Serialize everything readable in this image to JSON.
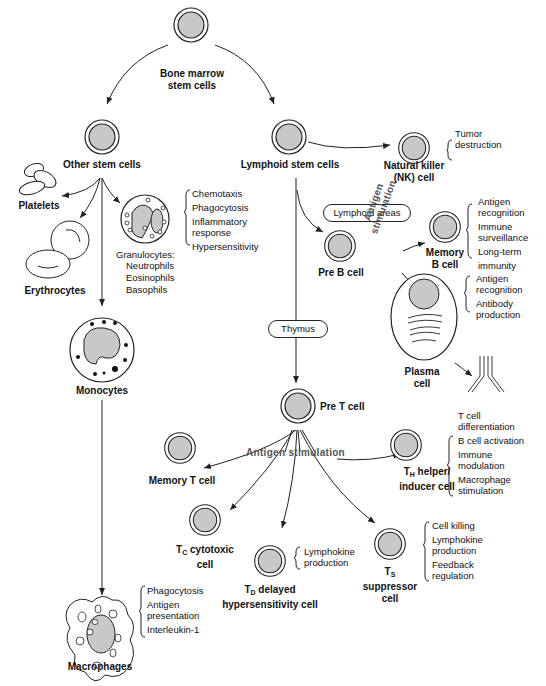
{
  "diagram": {
    "nodes": {
      "bone_marrow": {
        "label_line1": "Bone marrow",
        "label_line2": "stem cells"
      },
      "other_stem": {
        "label": "Other stem cells"
      },
      "lymphoid_stem": {
        "label": "Lymphoid stem cells"
      },
      "nk_cell": {
        "label_line1": "Natural killer",
        "label_line2": "(NK) cell",
        "functions": [
          "Tumor",
          "destruction"
        ]
      },
      "platelets": {
        "label": "Platelets"
      },
      "erythrocytes": {
        "label": "Erythrocytes"
      },
      "granulocytes": {
        "label": "Granulocytes:",
        "types": [
          "Neutrophils",
          "Eosinophils",
          "Basophils"
        ],
        "functions": [
          "Chemotaxis",
          "Phagocytosis",
          "Inflammatory",
          "response",
          "Hypersensitivity"
        ]
      },
      "monocytes": {
        "label": "Monocytes"
      },
      "macrophages": {
        "label": "Macrophages",
        "functions": [
          "Phagocytosis",
          "Antigen",
          "presentation",
          "Interleukin-1"
        ]
      },
      "pre_b": {
        "label": "Pre B cell"
      },
      "memory_b": {
        "label_line1": "Memory",
        "label_line2": "B cell",
        "functions": [
          "Antigen",
          "recognition",
          "Immune",
          "surveillance",
          "Long-term",
          "immunity"
        ]
      },
      "plasma": {
        "label_line1": "Plasma",
        "label_line2": "cell",
        "functions": [
          "Antigen",
          "recognition",
          "Antibody",
          "production"
        ]
      },
      "pre_t": {
        "label": "Pre T cell"
      },
      "memory_t": {
        "label": "Memory T cell"
      },
      "th_cell": {
        "label_sub": "H",
        "label_line1_rest": " helper/",
        "label_line2": "inducer cell",
        "functions": [
          "T cell",
          "differentiation",
          "B cell activation",
          "Immune",
          "modulation",
          "Macrophage",
          "stimulation"
        ]
      },
      "tc_cell": {
        "label_sub": "C",
        "label_line1_rest": " cytotoxic",
        "label_line2": "cell"
      },
      "td_cell": {
        "label_sub": "D",
        "label_line1_rest": " delayed",
        "label_line2": "hypersensitivity cell",
        "functions": [
          "Lymphokine",
          "production"
        ]
      },
      "ts_cell": {
        "label_sub": "S",
        "label_line2": "suppressor",
        "label_line3": "cell",
        "functions": [
          "Cell killing",
          "Lymphokine",
          "production",
          "Feedback",
          "regulation"
        ]
      }
    },
    "boxes": {
      "lymphoid_areas": "Lymphoid areas",
      "thymus": "Thymus"
    },
    "annotations": {
      "antigen_stim_b_line1": "Antigen",
      "antigen_stim_b_line2": "stimulation",
      "antigen_stim_t": "Antigen stimulation"
    },
    "colors": {
      "cell_fill": "#c8c8c8",
      "stroke": "#222222",
      "background": "#ffffff"
    }
  }
}
